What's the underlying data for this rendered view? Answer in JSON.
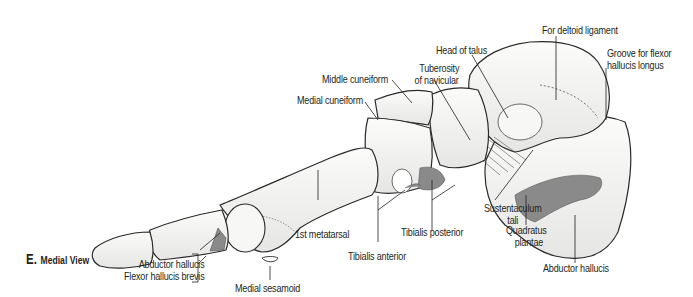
{
  "figure": {
    "panel_letter": "E.",
    "view_name": "Medial View"
  },
  "labels": {
    "for_deltoid_ligament": "For deltoid ligament",
    "groove_flexor_line1": "Groove for flexor",
    "groove_flexor_line2": "hallucis longus",
    "head_of_talus": "Head of talus",
    "tuberosity_line1": "Tuberosity",
    "tuberosity_line2": "of navicular",
    "middle_cuneiform": "Middle cuneiform",
    "medial_cuneiform": "Medial cuneiform",
    "first_metatarsal": "1st metatarsal",
    "tibialis_anterior": "Tibialis anterior",
    "tibialis_posterior": "Tibialis posterior",
    "sustentaculum_line1": "Sustentaculum",
    "sustentaculum_line2": "tali",
    "quadratus_line1": "Quadratus",
    "quadratus_line2": "plantae",
    "abductor_hallucis_heel": "Abductor hallucis",
    "abductor_hallucis_toe": "Abductor hallucis",
    "flexor_hallucis_brevis": "Flexor hallucis brevis",
    "medial_sesamoid": "Medial sesamoid"
  },
  "colors": {
    "bone_fill": "#f4f4f2",
    "bone_shade": "#dcdcda",
    "outline": "#2a2a2a",
    "muscle_attachment": "#8a8a8a",
    "leader_line": "#231f20"
  }
}
